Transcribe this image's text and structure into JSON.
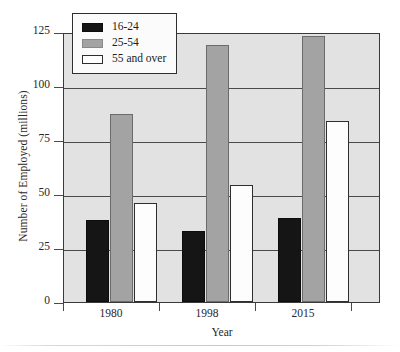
{
  "chart_data": {
    "type": "bar",
    "title": "",
    "xlabel": "Year",
    "ylabel": "Number of Employed (millions)",
    "categories": [
      "1980",
      "1998",
      "2015"
    ],
    "series": [
      {
        "name": "16-24",
        "color": "#151515",
        "values": [
          38,
          33,
          39
        ]
      },
      {
        "name": "25-54",
        "color": "#a3a3a3",
        "values": [
          87,
          119,
          123
        ]
      },
      {
        "name": "55 and over",
        "color": "#ffffff",
        "values": [
          46,
          54,
          84
        ]
      }
    ],
    "ylim": [
      0,
      125
    ],
    "yticks": [
      0,
      25,
      50,
      75,
      100,
      125
    ],
    "ytick_labels": [
      "0",
      "25",
      "50",
      "75",
      "100",
      "125"
    ],
    "grid": true,
    "legend_position": "top-left",
    "plot_background": "#e2e2e2"
  }
}
